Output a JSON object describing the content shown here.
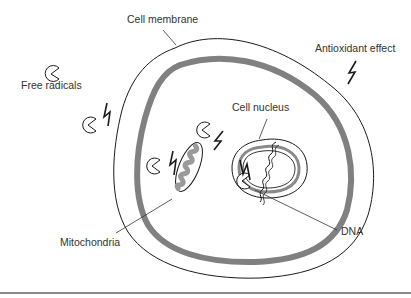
{
  "diagram": {
    "labels": {
      "cell_membrane": "Cell membrane",
      "antioxidant_effect": "Antioxidant effect",
      "free_radicals": "Free radicals",
      "cell_nucleus": "Cell nucleus",
      "mitochondria": "Mitochondria",
      "dna": "DNA"
    },
    "legend": [
      {
        "icon": "free-radical-pacman-icon",
        "meaning": "Free radicals"
      },
      {
        "icon": "lightning-bolt-icon",
        "meaning": "Antioxidant effect"
      }
    ],
    "components": [
      "Cell membrane",
      "Cell nucleus",
      "Mitochondria",
      "DNA"
    ],
    "colors": {
      "line": "#1a1a1a",
      "membrane_band": "#808080",
      "mitochondria_fill": "#e6e6e6",
      "text": "#333333",
      "bottom_rule": "#8a8a8a"
    }
  }
}
